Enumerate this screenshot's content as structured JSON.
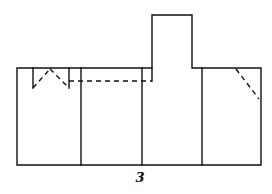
{
  "figure": {
    "label": "3",
    "stroke_color": "#111111",
    "background": "#ffffff"
  },
  "diagram": {
    "type": "unfolded paper pattern / net",
    "panels": 4,
    "elements": [
      {
        "name": "base-rectangle",
        "style": "solid"
      },
      {
        "name": "panel-divider-1",
        "style": "solid"
      },
      {
        "name": "panel-divider-2",
        "style": "solid"
      },
      {
        "name": "panel-divider-3",
        "style": "solid"
      },
      {
        "name": "top-tab",
        "style": "solid"
      },
      {
        "name": "left-notch-cut-lines",
        "style": "solid"
      },
      {
        "name": "left-notch-fold-lines",
        "style": "dashed"
      },
      {
        "name": "horizontal-fold-line",
        "style": "dashed"
      },
      {
        "name": "right-corner-fold-line",
        "style": "dashed"
      }
    ]
  }
}
